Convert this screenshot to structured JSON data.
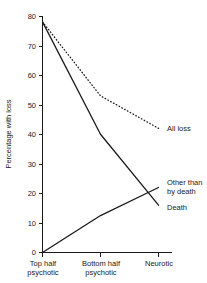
{
  "chart_data": {
    "type": "line",
    "title": "",
    "xlabel": "",
    "ylabel": "Percentage with loss",
    "categories": [
      "Top half\npsychotic",
      "Bottom half\npsychotic",
      "Neurotic"
    ],
    "category_labels": [
      {
        "line1": "Top half",
        "line2": "psychotic"
      },
      {
        "line1": "Bottom half",
        "line2": "psychotic"
      },
      {
        "line1": "Neurotic",
        "line2": ""
      }
    ],
    "ylim": [
      0,
      80
    ],
    "yticks": [
      0,
      10,
      20,
      30,
      40,
      50,
      60,
      70,
      80
    ],
    "ytick_labels": [
      "0",
      "10",
      "20",
      "30",
      "40",
      "50",
      "60",
      "70",
      "80"
    ],
    "grid": false,
    "legend_position": "right-inline",
    "series": [
      {
        "name": "All loss",
        "style": "dotted",
        "color": "#1a1a1a",
        "values": [
          78,
          53,
          42
        ]
      },
      {
        "name": "Death",
        "style": "solid",
        "color": "#1a1a1a",
        "values": [
          78,
          40,
          16
        ]
      },
      {
        "name": "Other than by death",
        "style": "solid",
        "color": "#1a1a1a",
        "values": [
          0,
          12.5,
          22
        ]
      }
    ],
    "annotations": [
      {
        "text": "All loss",
        "series": "All loss"
      },
      {
        "text_line1": "Other than",
        "text_line2": "by death",
        "series": "Other than by death"
      },
      {
        "text": "Death",
        "series": "Death"
      }
    ]
  },
  "axis": {
    "y_title": "Percentage with loss"
  },
  "labels": {
    "all_loss": "All loss",
    "other_than": "Other than",
    "by_death": "by death",
    "death": "Death"
  }
}
